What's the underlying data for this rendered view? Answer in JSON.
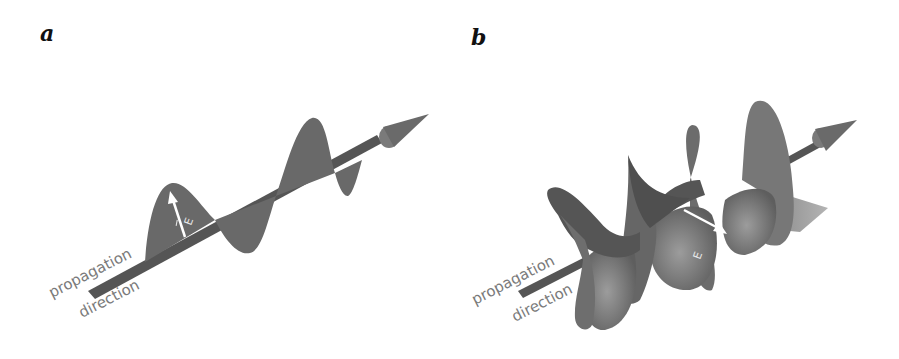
{
  "panels": [
    {
      "label": "a",
      "title": "Linearly polarized wave",
      "caption_line1": "propagation",
      "caption_line2": "direction",
      "field_label": "E"
    },
    {
      "label": "b",
      "title": "Circularly polarized wave",
      "caption_line1": "propagation",
      "caption_line2": "direction",
      "field_label": "E"
    }
  ],
  "colors": {
    "wave": "#6a6a6a",
    "wave_dark": "#4a4a4a",
    "wave_light": "#9a9a9a",
    "axis": "#505050",
    "caption": "#7a7a7a",
    "arrow_vector": "#ffffff"
  }
}
